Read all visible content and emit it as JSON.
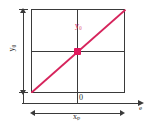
{
  "figure": {
    "type": "line-diagram",
    "title": "",
    "background": "#ffffff",
    "accent_color": "#d6245c",
    "line_color": "#3a3a3a"
  },
  "labels": {
    "y_axis_dimension": "y₀",
    "x_axis_dimension": "xₚ",
    "origin": "0",
    "line_label": "y₀",
    "axis_end": "e"
  },
  "chart_data": {
    "type": "line",
    "title": "",
    "xlabel": "e",
    "ylabel": "",
    "x": [
      0,
      1
    ],
    "series": [
      {
        "name": "y₀",
        "values": [
          0,
          1
        ],
        "color": "#d6245c"
      }
    ],
    "annotations": [
      {
        "text": "y₀",
        "kind": "line-label",
        "color": "#d6245c"
      },
      {
        "text": "0",
        "kind": "origin-tick"
      },
      {
        "text": "y₀",
        "kind": "vertical-dimension"
      },
      {
        "text": "xₚ",
        "kind": "horizontal-dimension"
      },
      {
        "text": "e",
        "kind": "axis-end-label"
      }
    ],
    "markers": [
      {
        "x": 0.5,
        "y": 0.5,
        "shape": "square",
        "color": "#e0185c"
      }
    ],
    "grid": true,
    "legend": "none"
  }
}
